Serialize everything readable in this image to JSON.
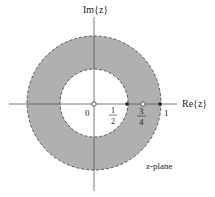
{
  "diagram": {
    "type": "z-plane region of convergence",
    "labels": {
      "imag_axis": "Im{z}",
      "real_axis": "Re{z}",
      "origin": "0",
      "half_num": "1",
      "half_den": "2",
      "three_quarter_num": "3",
      "three_quarter_den": "4",
      "one": "1",
      "plane": "z-plane"
    },
    "roc": {
      "inner_radius": 0.5,
      "outer_radius": 1,
      "boundary_style": "dashed"
    },
    "markers": [
      {
        "label": "zero at origin",
        "re": 0,
        "type": "open-circle"
      },
      {
        "label": "pole at 1/2",
        "re": 0.5,
        "type": "filled-dot"
      },
      {
        "label": "zero at 3/4",
        "re": 0.75,
        "type": "open-circle"
      },
      {
        "label": "pole at 1",
        "re": 1,
        "type": "filled-dot"
      }
    ],
    "colors": {
      "roc_fill": "#b0b0b0",
      "axis": "#555555",
      "boundary": "#444444",
      "background": "#ffffff"
    }
  }
}
